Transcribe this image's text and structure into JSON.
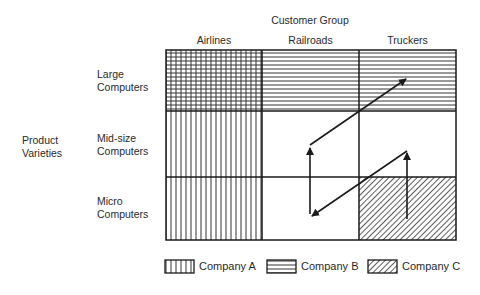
{
  "title": "Customer Group",
  "y_axis_label": [
    "Product",
    "Varieties"
  ],
  "columns": [
    {
      "label": "Airlines"
    },
    {
      "label": "Railroads"
    },
    {
      "label": "Truckers"
    }
  ],
  "rows": [
    {
      "label_line1": "Large",
      "label_line2": "Computers"
    },
    {
      "label_line1": "Mid-size",
      "label_line2": "Computers"
    },
    {
      "label_line1": "Micro",
      "label_line2": "Computers"
    }
  ],
  "cells": [
    [
      "Company A + Company B",
      "Company B",
      "Company B"
    ],
    [
      "Company A",
      "",
      ""
    ],
    [
      "Company A",
      "",
      "Company C"
    ]
  ],
  "arrows": [
    {
      "from": "Railroads / Micro",
      "to": "Railroads / Mid-size",
      "direction": "up"
    },
    {
      "from": "Railroads / Mid-size",
      "to": "Truckers / Large",
      "direction": "diagonal up-right"
    },
    {
      "from": "Truckers / Micro",
      "to": "Truckers / Mid-size",
      "direction": "up"
    },
    {
      "from": "Truckers / Mid-size",
      "to": "Railroads / Micro",
      "direction": "diagonal down-left"
    }
  ],
  "legend": [
    {
      "label": "Company A",
      "pattern": "vertical-lines"
    },
    {
      "label": "Company B",
      "pattern": "horizontal-lines"
    },
    {
      "label": "Company C",
      "pattern": "diagonal-lines"
    }
  ],
  "colors": {
    "line": "#1a1a1a",
    "hatch": "#333333",
    "background": "#ffffff"
  }
}
